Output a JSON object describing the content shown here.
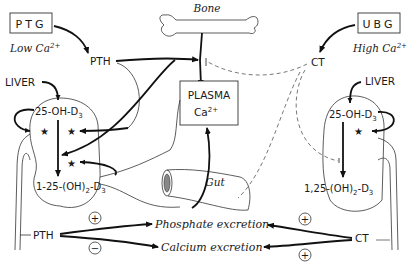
{
  "diagram": {
    "left_gland": {
      "label": "PTG",
      "condition": "Low Ca",
      "condition_sup": "2+"
    },
    "right_gland": {
      "label": "UBG",
      "condition": "High Ca",
      "condition_sup": "2+"
    },
    "bone": {
      "label": "Bone"
    },
    "plasma": {
      "line1": "PLASMA",
      "line2": "Ca",
      "sup": "2+"
    },
    "gut": {
      "label": "Gut"
    },
    "hormones": {
      "pth_top": "PTH",
      "ct_top": "CT",
      "pth_bottom": "PTH",
      "ct_bottom": "CT"
    },
    "left_kidney": {
      "liver": "LIVER",
      "precursor": "25-OH-D",
      "precursor_sub": "3",
      "product": "1-25-(OH)",
      "product_sub1": "2",
      "product_mid": "-D",
      "product_sub2": "3",
      "stars": [
        "★",
        "★",
        "★"
      ]
    },
    "right_kidney": {
      "liver": "LIVER",
      "precursor": "25-OH-D",
      "precursor_sub": "3",
      "product": "1,25-(OH)",
      "product_sub1": "2",
      "product_mid": "-D",
      "product_sub2": "3",
      "stars": [
        "★"
      ]
    },
    "excretion": {
      "phosphate": "Phosphate excretion",
      "calcium": "Calcium excretion",
      "pth_phosphate_sign": "+",
      "pth_calcium_sign": "−",
      "ct_phosphate_sign": "+",
      "ct_calcium_sign": "+"
    }
  }
}
